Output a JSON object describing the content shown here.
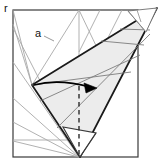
{
  "diagram": {
    "kind": "origami-fold-step-diagram",
    "canvas": {
      "width": 164,
      "height": 166
    },
    "labels": {
      "point_a": "a",
      "corner_mark": "r"
    },
    "colors": {
      "paper_outline": "#3a3a3a",
      "crease_line": "#9a9a9a",
      "flap_outline": "#1a1a1a",
      "flap_fill": "#ebebeb",
      "flap_fill_dark": "#e0e0e0",
      "fold_dashed": "#2b2b2b",
      "arrow": "#000000",
      "background": "#ffffff",
      "label": "#111111"
    },
    "geometry": {
      "sheet": {
        "left": 13,
        "top": 10,
        "right": 138,
        "bottom": 157
      },
      "center_crease_x": 79,
      "flap_apex_top_right": [
        157,
        8
      ],
      "flap_vertex_left": [
        32,
        85
      ],
      "flap_tip_bottom": [
        80,
        157
      ],
      "fold_axis_x": 79,
      "fold_axis_from_y": 85,
      "fold_axis_to_y": 157,
      "arrow_from": [
        36,
        86
      ],
      "arrow_to": [
        96,
        88
      ]
    },
    "elements": {
      "sheet_name": "paper-sheet-outline",
      "flap_name": "folded-flap",
      "arrow_name": "fold-direction-arrow",
      "dashed_name": "fold-axis-dashed-line",
      "creases_name": "crease-lines",
      "label_a_name": "label-point-a",
      "corner_name": "corner-tick-mark"
    }
  }
}
